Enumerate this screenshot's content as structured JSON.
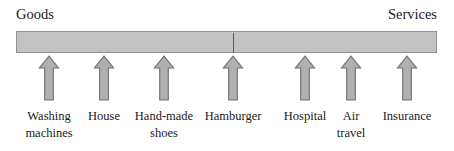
{
  "figure": {
    "left_end_label": "Goods",
    "right_end_label": "Services",
    "bar_color": "#c2c2c2",
    "bar_border_color": "#8f8f8f",
    "midpoint_tick_color": "#5c5c5c",
    "arrow_fill_color": "#b0b0b0",
    "arrow_stroke_color": "#6e6e6e",
    "text_color": "#1a1a1a",
    "background_color": "#ffffff"
  },
  "items": [
    {
      "line1": "Washing",
      "line2": "machines",
      "center_x": 49,
      "arrow_name": "arrow-washing-machines"
    },
    {
      "line1": "House",
      "line2": "",
      "center_x": 104,
      "arrow_name": "arrow-house"
    },
    {
      "line1": "Hand-made",
      "line2": "shoes",
      "center_x": 164,
      "arrow_name": "arrow-hand-made-shoes"
    },
    {
      "line1": "Hamburger",
      "line2": "",
      "center_x": 233,
      "arrow_name": "arrow-hamburger"
    },
    {
      "line1": "Hospital",
      "line2": "",
      "center_x": 305,
      "arrow_name": "arrow-hospital"
    },
    {
      "line1": "Air",
      "line2": "travel",
      "center_x": 351,
      "arrow_name": "arrow-air-travel"
    },
    {
      "line1": "Insurance",
      "line2": "",
      "center_x": 407,
      "arrow_name": "arrow-insurance"
    }
  ],
  "chart_data": {
    "type": "diagram",
    "axis_labels": {
      "left": "Goods",
      "right": "Services"
    },
    "categories": [
      "Washing machines",
      "House",
      "Hand-made shoes",
      "Hamburger",
      "Hospital",
      "Air travel",
      "Insurance"
    ],
    "positions_px": [
      49,
      104,
      164,
      233,
      305,
      351,
      407
    ],
    "axis_range_px": [
      16,
      437
    ],
    "midpoint_px": 232,
    "grid": false,
    "legend": "none"
  }
}
